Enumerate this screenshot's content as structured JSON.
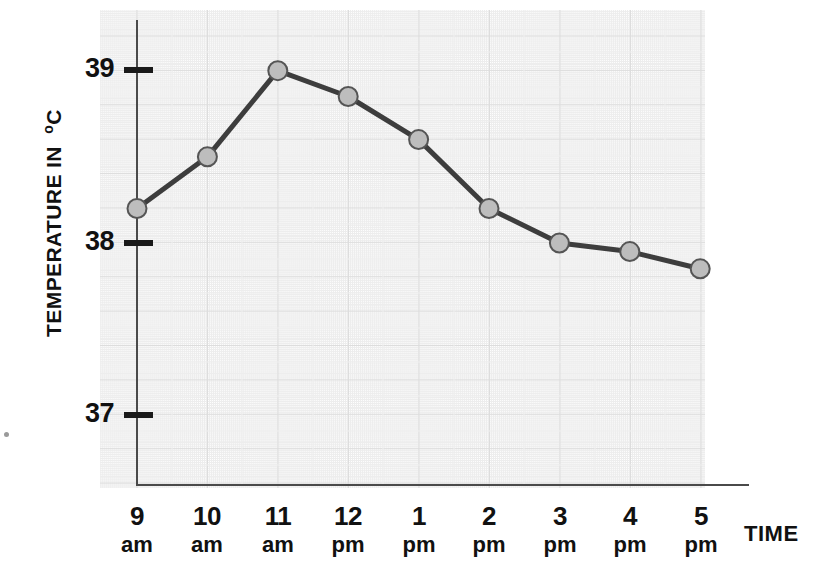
{
  "chart_data": {
    "type": "line",
    "title": "",
    "xlabel": "TIME",
    "ylabel": "TEMPERATURE IN °C",
    "categories": [
      "9 am",
      "10 am",
      "11 am",
      "12 pm",
      "1 pm",
      "2 pm",
      "3 pm",
      "4 pm",
      "5 pm"
    ],
    "x_hours": [
      "9",
      "10",
      "11",
      "12",
      "1",
      "2",
      "3",
      "4",
      "5"
    ],
    "x_meridiem": [
      "am",
      "am",
      "am",
      "pm",
      "pm",
      "pm",
      "pm",
      "pm",
      "pm"
    ],
    "values": [
      38.2,
      38.5,
      39.0,
      38.85,
      38.6,
      38.2,
      38.0,
      37.95,
      37.85
    ],
    "ylim": [
      36.6,
      39.3
    ],
    "y_ticks": [
      37,
      38,
      39
    ],
    "y_tick_labels": [
      "37",
      "38",
      "39"
    ],
    "minor_gridline_step": 0.2,
    "grid": true,
    "legend": "none",
    "series_name": "Temperature",
    "colors": {
      "line": "#3d3d3d",
      "marker_fill": "#bdbdbd",
      "marker_stroke": "#555555",
      "axis": "#4a4a4a",
      "tick": "#1a1a1a",
      "text": "#111111",
      "grid_major": "#d8d8d8",
      "grid_minor": "#ececec",
      "background": "#ffffff"
    }
  },
  "axis_titles": {
    "y_main": "TEMPERATURE IN",
    "y_unit": "o",
    "y_unit_letter": "C",
    "x": "TIME"
  }
}
